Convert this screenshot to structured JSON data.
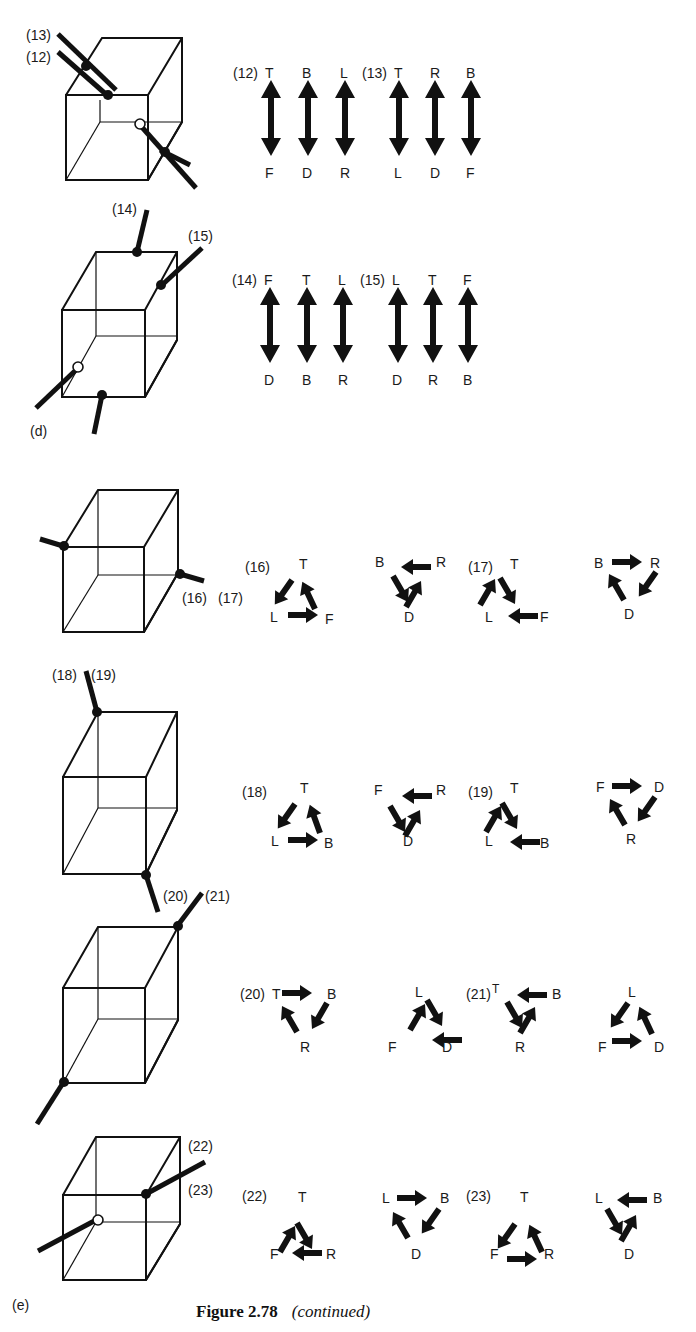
{
  "page": {
    "caption_number": "Figure 2.78",
    "caption_note": "(continued)",
    "panel_labels": {
      "d": "(d)",
      "e": "(e)"
    }
  },
  "cubes": [
    {
      "id": "cube-12-13",
      "axis_labels": [
        "(13)",
        "(12)"
      ]
    },
    {
      "id": "cube-14-15",
      "axis_labels": [
        "(14)",
        "(15)"
      ]
    },
    {
      "id": "cube-16-17",
      "axis_labels": [
        "(16)",
        "(17)"
      ]
    },
    {
      "id": "cube-18-19",
      "axis_labels": [
        "(18)",
        "(19)"
      ]
    },
    {
      "id": "cube-20-21",
      "axis_labels": [
        "(20)",
        "(21)"
      ]
    },
    {
      "id": "cube-22-23",
      "axis_labels": [
        "(22)",
        "(23)"
      ]
    }
  ],
  "swaps": [
    {
      "label": "(12)",
      "pairs": [
        [
          "T",
          "F"
        ],
        [
          "B",
          "D"
        ],
        [
          "L",
          "R"
        ]
      ]
    },
    {
      "label": "(13)",
      "pairs": [
        [
          "T",
          "L"
        ],
        [
          "R",
          "D"
        ],
        [
          "B",
          "F"
        ]
      ]
    },
    {
      "label": "(14)",
      "pairs": [
        [
          "F",
          "D"
        ],
        [
          "T",
          "B"
        ],
        [
          "L",
          "R"
        ]
      ]
    },
    {
      "label": "(15)",
      "pairs": [
        [
          "L",
          "D"
        ],
        [
          "T",
          "R"
        ],
        [
          "F",
          "B"
        ]
      ]
    }
  ],
  "cycles": [
    {
      "label": "(16)",
      "groups": [
        {
          "top": "T",
          "left": "L",
          "right": "F"
        },
        {
          "top_left": "B",
          "top_right": "R",
          "bottom": "D"
        }
      ]
    },
    {
      "label": "(17)",
      "groups": [
        {
          "top": "T",
          "left": "L",
          "right": "F"
        },
        {
          "top_left": "B",
          "top_right": "R",
          "bottom": "D"
        }
      ]
    },
    {
      "label": "(18)",
      "groups": [
        {
          "top": "T",
          "left": "L",
          "right": "B"
        },
        {
          "top_left": "F",
          "top_right": "R",
          "bottom": "D"
        }
      ]
    },
    {
      "label": "(19)",
      "groups": [
        {
          "top": "T",
          "left": "L",
          "right": "B"
        },
        {
          "top_left": "F",
          "top_right": "D",
          "bottom": "R"
        }
      ]
    },
    {
      "label": "(20)",
      "groups": [
        {
          "top_left": "T",
          "top_right": "B",
          "bottom": "R"
        },
        {
          "top": "L",
          "left": "F",
          "right": "D"
        }
      ]
    },
    {
      "label": "(21)",
      "groups": [
        {
          "top_left": "T",
          "top_right": "B",
          "bottom": "R"
        },
        {
          "top": "L",
          "left": "F",
          "right": "D"
        }
      ]
    },
    {
      "label": "(22)",
      "groups": [
        {
          "top": "T",
          "left": "F",
          "right": "R"
        },
        {
          "top_left": "L",
          "top_right": "B",
          "bottom": "D"
        }
      ]
    },
    {
      "label": "(23)",
      "groups": [
        {
          "top": "T",
          "left": "F",
          "right": "R"
        },
        {
          "top_left": "L",
          "top_right": "B",
          "bottom": "D"
        }
      ]
    }
  ],
  "cycle16_17_extra_labels": {
    "left_axis": "(16)",
    "right_axis": "(17)"
  }
}
